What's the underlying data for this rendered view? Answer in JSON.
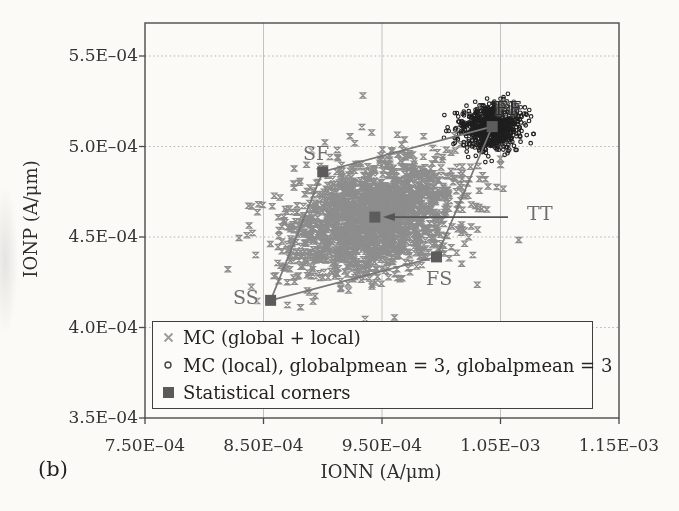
{
  "figure_label": "(b)",
  "axes": {
    "x": {
      "title": "IONN (A/μm)",
      "tick_labels": [
        "7.50E–04",
        "8.50E–04",
        "9.50E–04",
        "1.05E–03",
        "1.15E–03"
      ],
      "tick_values": [
        0.00075,
        0.00085,
        0.00095,
        0.00105,
        0.00115
      ]
    },
    "y": {
      "title": "IONP (A/μm)",
      "tick_labels": [
        "5.5E–04",
        "5.0E–04",
        "4.5E–04",
        "4.0E–04",
        "3.5E–04"
      ],
      "tick_values": [
        0.00055,
        0.0005,
        0.00045,
        0.0004,
        0.00035
      ]
    }
  },
  "legend": {
    "items": [
      {
        "marker": "x-cross",
        "label": "MC (global + local)",
        "color": "#9a9a9a"
      },
      {
        "marker": "open-circle",
        "label": "MC (local), globalpmean = 3, globalpmean = 3",
        "color": "#2b2b2b"
      },
      {
        "marker": "filled-square",
        "label": "Statistical corners",
        "color": "#5a5a5a"
      }
    ]
  },
  "chart_data": {
    "type": "scatter",
    "xlabel": "IONN (A/μm)",
    "ylabel": "IONP (A/μm)",
    "xlim": [
      0.00075,
      0.00115
    ],
    "ylim": [
      0.00035,
      0.00055
    ],
    "grid": true,
    "legend_position": "inside-bottom-left",
    "series": [
      {
        "name": "MC (global + local)",
        "marker": "x",
        "color": "#8d8d8d",
        "distribution": {
          "type": "gaussian",
          "center": [
            0.000944,
            0.000461
          ],
          "sigma": [
            3.7e-05,
            1.7e-05
          ],
          "corr": 0.3,
          "n": 1700
        }
      },
      {
        "name": "MC (local), globalpmean = 3, globalpmean = 3",
        "marker": "open-circle",
        "color": "#1f1f1f",
        "distribution": {
          "type": "gaussian",
          "center": [
            0.001043,
            0.000511
          ],
          "sigma": [
            1.3e-05,
            6.3e-06
          ],
          "corr": 0.15,
          "n": 850
        }
      },
      {
        "name": "Statistical corners",
        "marker": "filled-square",
        "color": "#5c5c5c",
        "points": [
          {
            "label": "SS",
            "x": 0.000856,
            "y": 0.000415
          },
          {
            "label": "SF",
            "x": 0.0009,
            "y": 0.000486
          },
          {
            "label": "FF",
            "x": 0.001043,
            "y": 0.000511
          },
          {
            "label": "FS",
            "x": 0.000996,
            "y": 0.000439
          },
          {
            "label": "TT",
            "x": 0.000944,
            "y": 0.000461
          }
        ]
      }
    ],
    "corner_connections": [
      "SS",
      "SF",
      "FF",
      "FS",
      "SS"
    ],
    "tt_annotation": {
      "label": "TT",
      "style": "horizontal-arrow-pointing-left-at-TT-marker"
    }
  }
}
